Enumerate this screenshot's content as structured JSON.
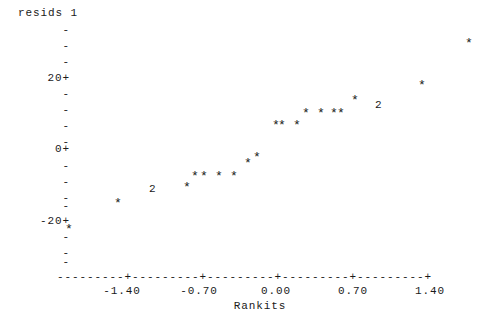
{
  "plot": {
    "y_axis_title": "resids 1",
    "x_axis_title": "Rankits",
    "axis_line": "---------+---------+---------+---------+---------+",
    "y_ticks": [
      {
        "label": "-",
        "y": 30
      },
      {
        "label": "-",
        "y": 46
      },
      {
        "label": "-",
        "y": 62
      },
      {
        "label": "20+",
        "y": 78
      },
      {
        "label": "-",
        "y": 94
      },
      {
        "label": "-",
        "y": 110
      },
      {
        "label": "-",
        "y": 126
      },
      {
        "label": "-",
        "y": 142
      },
      {
        "label": "0+",
        "y": 149
      },
      {
        "label": "-",
        "y": 166
      },
      {
        "label": "-",
        "y": 182
      },
      {
        "label": "-",
        "y": 198
      },
      {
        "label": "-",
        "y": 206
      },
      {
        "label": "-20+",
        "y": 221
      },
      {
        "label": "-",
        "y": 237
      },
      {
        "label": "-",
        "y": 253
      },
      {
        "label": "-",
        "y": 262
      }
    ],
    "x_ticks": [
      {
        "label": "-1.40",
        "x": 122
      },
      {
        "label": "-0.70",
        "x": 199
      },
      {
        "label": "0.00",
        "x": 276
      },
      {
        "label": "0.70",
        "x": 353
      },
      {
        "label": "1.40",
        "x": 430
      }
    ]
  },
  "chart_data": {
    "type": "scatter",
    "title": "resids 1",
    "xlabel": "Rankits",
    "ylabel": "resids 1",
    "xlim": [
      -1.85,
      1.95
    ],
    "ylim": [
      -32,
      38
    ],
    "xticks": [
      -1.4,
      -0.7,
      0.0,
      0.7,
      1.4
    ],
    "yticks": [
      20,
      0,
      -20
    ],
    "grid": false,
    "legend": null,
    "marker": "*",
    "overplot_marker": "2",
    "overplot_note": "A digit replaces the star glyph where that many points coincide",
    "points": [
      {
        "glyph": "*",
        "x": -1.83,
        "y": -23.0,
        "px": 68,
        "py": 232
      },
      {
        "glyph": "*",
        "x": -1.38,
        "y": -16.5,
        "px": 117,
        "py": 206
      },
      {
        "glyph": "2",
        "x": -1.06,
        "y": -11.5,
        "px": 152,
        "py": 190
      },
      {
        "glyph": "*",
        "x": -0.74,
        "y": -11.0,
        "px": 186,
        "py": 190
      },
      {
        "glyph": "*",
        "x": -0.66,
        "y": -8.0,
        "px": 194,
        "py": 179
      },
      {
        "glyph": "*",
        "x": -0.58,
        "y": -8.0,
        "px": 203,
        "py": 179
      },
      {
        "glyph": "*",
        "x": -0.44,
        "y": -8.0,
        "px": 218,
        "py": 179
      },
      {
        "glyph": "*",
        "x": -0.3,
        "y": -8.0,
        "px": 233,
        "py": 179
      },
      {
        "glyph": "*",
        "x": -0.17,
        "y": -4.0,
        "px": 247,
        "py": 166
      },
      {
        "glyph": "*",
        "x": -0.08,
        "y": -2.0,
        "px": 256,
        "py": 160
      },
      {
        "glyph": "*",
        "x": 0.08,
        "y": 3.0,
        "px": 275,
        "py": 128
      },
      {
        "glyph": "*",
        "x": 0.13,
        "y": 3.0,
        "px": 281,
        "py": 128
      },
      {
        "glyph": "*",
        "x": 0.27,
        "y": 3.0,
        "px": 296,
        "py": 128
      },
      {
        "glyph": "*",
        "x": 0.35,
        "y": 6.0,
        "px": 305,
        "py": 116
      },
      {
        "glyph": "*",
        "x": 0.49,
        "y": 6.0,
        "px": 320,
        "py": 116
      },
      {
        "glyph": "*",
        "x": 0.61,
        "y": 6.0,
        "px": 333,
        "py": 116
      },
      {
        "glyph": "*",
        "x": 0.67,
        "y": 6.0,
        "px": 340,
        "py": 116
      },
      {
        "glyph": "*",
        "x": 0.79,
        "y": 9.5,
        "px": 354,
        "py": 103
      },
      {
        "glyph": "2",
        "x": 1.01,
        "y": 9.0,
        "px": 378,
        "py": 106
      },
      {
        "glyph": "*",
        "x": 1.35,
        "y": 15.0,
        "px": 421,
        "py": 88
      },
      {
        "glyph": "*",
        "x": 1.78,
        "y": 25.0,
        "px": 468,
        "py": 46
      }
    ]
  }
}
